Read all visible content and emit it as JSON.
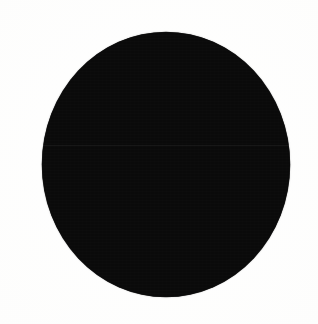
{
  "image": {
    "kind": "solid-black-circle-on-white",
    "description": "A single large solid black filled circle centered on a plain near-white background.",
    "canvas": {
      "width_px": 318,
      "height_px": 324,
      "background_color": "#fdfdfc"
    },
    "shapes": [
      {
        "name": "black-disc",
        "type": "ellipse",
        "fill_color": "#0a0a0a",
        "center_x_px": 166,
        "center_y_px": 164,
        "width_px": 248,
        "height_px": 265,
        "left_px": 42,
        "top_px": 32,
        "right_px": 290,
        "bottom_px": 297,
        "stroke": "none",
        "label": ""
      }
    ],
    "artifacts": {
      "scan_seam_y_px": 145,
      "scan_seam_description": "faint horizontal lighter line crossing the disc",
      "grain": "subtle scan noise inside the black fill",
      "edge": "softly anti-aliased rim"
    },
    "text_content": [],
    "colors": {
      "foreground": "#0a0a0a",
      "background": "#fdfdfc",
      "seam": "#141414"
    }
  }
}
